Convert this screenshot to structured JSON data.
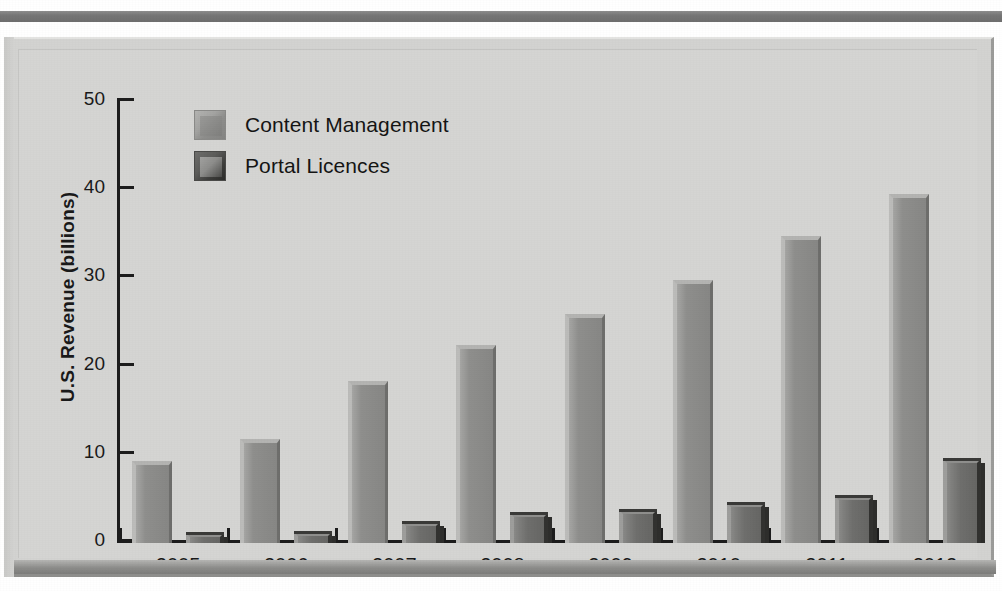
{
  "figure": {
    "frame_style": "beveled-plaque",
    "background_color": "#d3d3d1"
  },
  "legend": {
    "position": "top-left-inside",
    "entries": [
      {
        "label": "Content Management",
        "color": "#8f8f8d",
        "swatch": "legend-swatch-content-management"
      },
      {
        "label": "Portal Licences",
        "color": "#4a4a48",
        "swatch": "legend-swatch-portal-licences"
      }
    ]
  },
  "axes": {
    "y_label": "U.S. Revenue (billions)",
    "y_ticks": [
      "0",
      "10",
      "20",
      "30",
      "40",
      "50"
    ],
    "x_label": "",
    "x_ticks": [
      "2005",
      "2006",
      "2007",
      "2008",
      "2009",
      "2010",
      "2011",
      "2012"
    ]
  },
  "chart_data": {
    "type": "bar",
    "title": "",
    "subtitle": "",
    "xlabel": "",
    "ylabel": "U.S. Revenue (billions)",
    "ylim": [
      0,
      50
    ],
    "ytick_step": 10,
    "grid": false,
    "legend_position": "top-left",
    "categories": [
      "2005",
      "2006",
      "2007",
      "2008",
      "2009",
      "2010",
      "2011",
      "2012"
    ],
    "series": [
      {
        "name": "Content Management",
        "color": "#8f8f8d",
        "values": [
          9.3,
          11.8,
          18.4,
          22.4,
          26.0,
          29.8,
          34.8,
          39.6
        ]
      },
      {
        "name": "Portal Licences",
        "color": "#4a4a48",
        "values": [
          1.1,
          1.2,
          2.4,
          3.4,
          3.7,
          4.5,
          5.3,
          9.5
        ]
      }
    ]
  }
}
